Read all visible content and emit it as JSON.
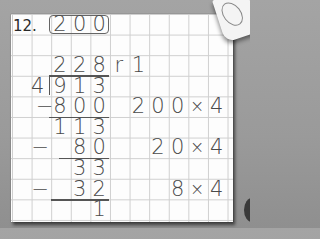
{
  "problem": {
    "number_label": "12.",
    "estimate_answer": [
      "2",
      "0",
      "0"
    ]
  },
  "division": {
    "quotient": [
      "2",
      "2",
      "8"
    ],
    "remainder_label": "r",
    "remainder_value": "1",
    "divisor": "4",
    "division_bracket": ")",
    "dividend": [
      "9",
      "1",
      "3"
    ],
    "steps": [
      {
        "minus": "−",
        "subtract": [
          "8",
          "0",
          "0"
        ],
        "result": [
          "1",
          "1",
          "3"
        ],
        "note": [
          "2",
          "0",
          "0",
          "×",
          "4"
        ]
      },
      {
        "minus": "−",
        "subtract": [
          "8",
          "0"
        ],
        "result": [
          "3",
          "3"
        ],
        "note": [
          "2",
          "0",
          "×",
          "4"
        ]
      },
      {
        "minus": "−",
        "subtract": [
          "3",
          "2"
        ],
        "result": [
          "1"
        ],
        "note": [
          "8",
          "×",
          "4"
        ]
      }
    ]
  },
  "colors": {
    "background": "#9a9a9a",
    "paper": "#fdfdfd",
    "grid_line": "#cfcfcf",
    "ink": "#4a4a4a"
  }
}
